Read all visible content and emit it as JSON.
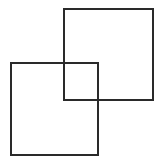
{
  "diagram": {
    "stroke_color": "#2a2a2a",
    "stroke_width": 2,
    "shapes": [
      {
        "name": "top-right-square",
        "left": 63,
        "top": 8,
        "width": 91,
        "height": 93
      },
      {
        "name": "bottom-left-square",
        "left": 10,
        "top": 62,
        "width": 89,
        "height": 94
      }
    ]
  }
}
